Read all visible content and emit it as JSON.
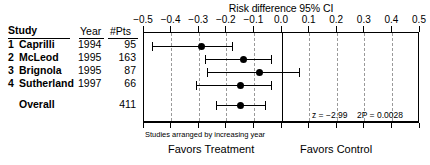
{
  "chart_data": {
    "type": "forest",
    "title": "Risk difference 95% CI",
    "xlabel": "",
    "ylabel": "",
    "xlim": [
      -0.5,
      0.5
    ],
    "grid": true,
    "legend_position": "none",
    "tick_labels": [
      "−0.5",
      "−0.4",
      "−0.3",
      "−0.2",
      "−0.1",
      "0.0",
      "0.1",
      "0.2",
      "0.3",
      "0.4",
      "0.5"
    ],
    "tick_values": [
      -0.5,
      -0.4,
      -0.3,
      -0.2,
      -0.1,
      0.0,
      0.1,
      0.2,
      0.3,
      0.4,
      0.5
    ],
    "null_value": 0.0,
    "columns": [
      "Study",
      "Year",
      "#Pts"
    ],
    "studies": [
      {
        "num": "1",
        "name": "Caprilli",
        "year": "1994",
        "pts": "95",
        "estimate": -0.29,
        "ci_low": -0.47,
        "ci_high": -0.18
      },
      {
        "num": "2",
        "name": "McLeod",
        "year": "1995",
        "pts": "163",
        "estimate": -0.14,
        "ci_low": -0.28,
        "ci_high": -0.04
      },
      {
        "num": "3",
        "name": "Brignola",
        "year": "1995",
        "pts": "87",
        "estimate": -0.08,
        "ci_low": -0.27,
        "ci_high": 0.06
      },
      {
        "num": "4",
        "name": "Sutherland",
        "year": "1997",
        "pts": "66",
        "estimate": -0.15,
        "ci_low": -0.31,
        "ci_high": -0.04
      }
    ],
    "overall": {
      "num": "",
      "name": "Overall",
      "year": "",
      "pts": "411",
      "estimate": -0.15,
      "ci_low": -0.24,
      "ci_high": -0.06
    },
    "annotations": {
      "z_stat": "z = −2.99",
      "p_value": "2P = 0.0028",
      "note": "Studies arranged by increasing year",
      "favors_left": "Favors Treatment",
      "favors_right": "Favors Control"
    },
    "colors": {
      "marker": "#000000",
      "grid": "#9a9a9a",
      "axis": "#000000",
      "background": "#ffffff"
    }
  }
}
